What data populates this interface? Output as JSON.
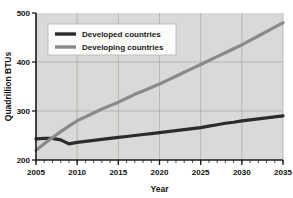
{
  "chart_data": {
    "type": "line",
    "title": "",
    "xlabel": "Year",
    "ylabel": "Quadrillion BTUs",
    "xlim": [
      2005,
      2035
    ],
    "ylim": [
      200,
      500
    ],
    "xticks": [
      2005,
      2010,
      2015,
      2020,
      2025,
      2030,
      2035
    ],
    "xtick_labels": [
      "2005",
      "2010",
      "2015",
      "2020",
      "2025",
      "2030",
      "2035"
    ],
    "yticks": [
      200,
      300,
      400,
      500
    ],
    "ytick_labels": [
      "200",
      "300",
      "400",
      "500"
    ],
    "minor_xtick_interval": 1,
    "grid": true,
    "legend_position": "upper left",
    "plot_background": "#d9d9d7",
    "figure_background": "#ffffff",
    "x": [
      2005,
      2006,
      2007,
      2008,
      2009,
      2010,
      2011,
      2012,
      2013,
      2014,
      2015,
      2016,
      2017,
      2018,
      2019,
      2020,
      2021,
      2022,
      2023,
      2024,
      2025,
      2026,
      2027,
      2028,
      2029,
      2030,
      2031,
      2032,
      2033,
      2034,
      2035
    ],
    "series": [
      {
        "name": "Developed countries",
        "color": "#2b2b2b",
        "linewidth": 3.2,
        "values": [
          243,
          244,
          244,
          241,
          233,
          236,
          238,
          240,
          242,
          244,
          246,
          248,
          250,
          252,
          254,
          256,
          258,
          260,
          262,
          264,
          266,
          269,
          272,
          275,
          277,
          280,
          282,
          284,
          286,
          288,
          290
        ]
      },
      {
        "name": "Developing countries",
        "color": "#8a8a8a",
        "linewidth": 3.2,
        "values": [
          220,
          233,
          246,
          258,
          269,
          280,
          288,
          296,
          304,
          311,
          318,
          326,
          334,
          341,
          348,
          355,
          363,
          371,
          379,
          387,
          395,
          403,
          411,
          419,
          427,
          435,
          444,
          453,
          462,
          471,
          480
        ]
      }
    ],
    "legend": [
      {
        "label": "Developed countries",
        "color": "#2b2b2b"
      },
      {
        "label": "Developing countries",
        "color": "#8a8a8a"
      }
    ]
  }
}
